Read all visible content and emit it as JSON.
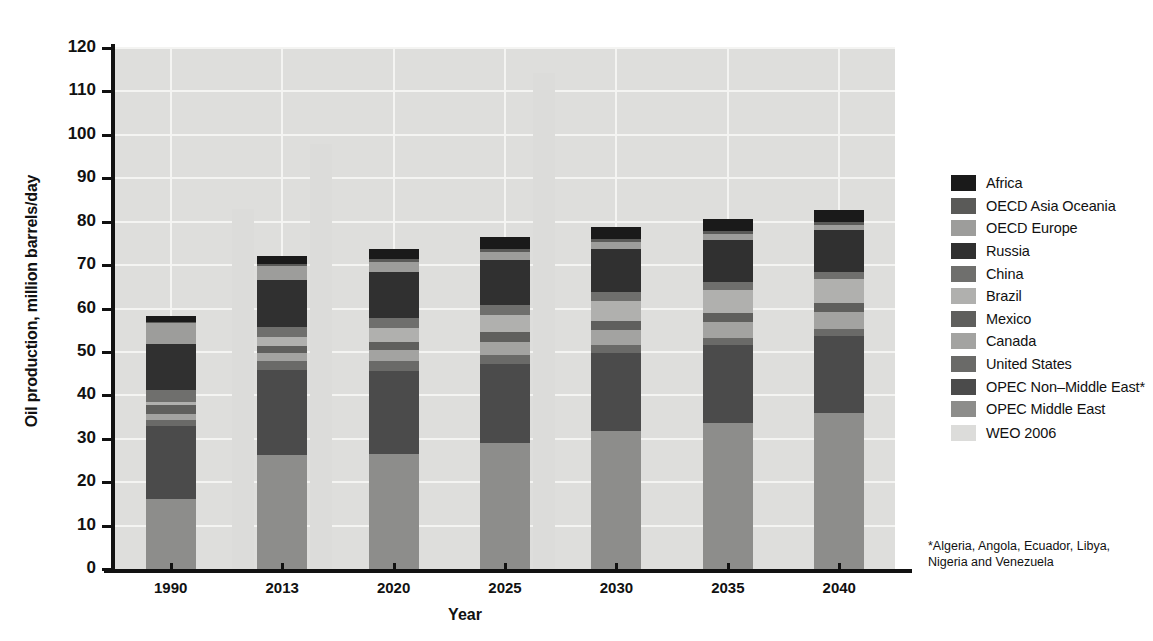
{
  "chart_data": {
    "type": "bar",
    "subtype": "stacked-bar-with-overlay",
    "title": "",
    "xlabel": "Year",
    "ylabel": "Oil production, million barrels/day",
    "ylim": [
      0,
      120
    ],
    "ytick_values": [
      0,
      10,
      20,
      30,
      40,
      50,
      60,
      70,
      80,
      90,
      100,
      110,
      120
    ],
    "ytick_labels": [
      "0",
      "10",
      "20",
      "30",
      "40",
      "50",
      "60",
      "70",
      "80",
      "90",
      "100",
      "110",
      "120"
    ],
    "grid": true,
    "legend_position": "right",
    "categories": [
      "1990",
      "2013",
      "2020",
      "2025",
      "2030",
      "2035",
      "2040"
    ],
    "stack_order_bottom_to_top": [
      "OPEC Middle East",
      "OPEC Non–Middle East*",
      "United States",
      "Canada",
      "Mexico",
      "Brazil",
      "China",
      "Russia",
      "OECD Europe",
      "OECD Asia Oceania",
      "Africa"
    ],
    "series": [
      {
        "name": "OPEC Middle East",
        "color": "#8d8d8b",
        "values": [
          16.2,
          26.2,
          26.6,
          29.0,
          31.8,
          33.7,
          35.9
        ]
      },
      {
        "name": "OPEC Non–Middle East*",
        "color": "#4b4b4b",
        "values": [
          16.7,
          19.7,
          19.0,
          18.3,
          18.0,
          18.0,
          17.8
        ]
      },
      {
        "name": "United States",
        "color": "#6a6a68",
        "values": [
          1.5,
          2.0,
          2.4,
          2.1,
          1.8,
          1.6,
          1.5
        ]
      },
      {
        "name": "Canada",
        "color": "#a3a3a1",
        "values": [
          1.3,
          1.8,
          2.4,
          3.0,
          3.4,
          3.7,
          4.0
        ]
      },
      {
        "name": "Mexico",
        "color": "#5f5f5d",
        "values": [
          2.0,
          1.7,
          1.9,
          2.1,
          2.1,
          2.0,
          2.0
        ]
      },
      {
        "name": "Brazil",
        "color": "#b0b0ae",
        "values": [
          0.8,
          2.0,
          3.2,
          4.0,
          4.6,
          5.2,
          5.6
        ]
      },
      {
        "name": "China",
        "color": "#6f6f6d",
        "values": [
          2.8,
          2.4,
          2.3,
          2.2,
          2.0,
          1.8,
          1.7
        ]
      },
      {
        "name": "Russia",
        "color": "#303030",
        "values": [
          10.5,
          10.7,
          10.6,
          10.4,
          10.1,
          9.8,
          9.6
        ]
      },
      {
        "name": "OECD Europe",
        "color": "#9d9d9b",
        "values": [
          4.9,
          3.2,
          2.3,
          1.9,
          1.6,
          1.4,
          1.2
        ]
      },
      {
        "name": "OECD Asia Oceania",
        "color": "#5a5a58",
        "values": [
          0.3,
          0.6,
          0.7,
          0.8,
          0.7,
          0.6,
          0.6
        ]
      },
      {
        "name": "Africa",
        "color": "#1a1a1a",
        "values": [
          1.2,
          1.8,
          2.3,
          2.6,
          2.7,
          2.8,
          2.9
        ]
      }
    ],
    "totals": [
      58.2,
      72.1,
      73.7,
      76.4,
      78.8,
      80.6,
      82.8
    ],
    "overlay": {
      "name": "WEO 2006",
      "color": "#dcdcda",
      "points": [
        {
          "category": "2013",
          "value": 83.0,
          "offset": "left"
        },
        {
          "category": "2013",
          "value": 97.8,
          "offset": "right"
        },
        {
          "category": "2025",
          "value": 114.3,
          "offset": "right"
        }
      ]
    },
    "footnote": "*Algeria, Angola, Ecuador, Libya, Nigeria and Venezuela"
  },
  "axes": {
    "ylabel": "Oil production, million barrels/day",
    "xlabel": "Year",
    "yticks": [
      "120",
      "110",
      "100",
      "90",
      "80",
      "70",
      "60",
      "50",
      "40",
      "30",
      "20",
      "10",
      "0"
    ],
    "xticks": [
      "1990",
      "2013",
      "2020",
      "2025",
      "2030",
      "2035",
      "2040"
    ]
  },
  "legend": {
    "items": [
      {
        "label": "Africa",
        "color": "#1a1a1a"
      },
      {
        "label": "OECD Asia Oceania",
        "color": "#5a5a58"
      },
      {
        "label": "OECD Europe",
        "color": "#9d9d9b"
      },
      {
        "label": "Russia",
        "color": "#303030"
      },
      {
        "label": "China",
        "color": "#6f6f6d"
      },
      {
        "label": "Brazil",
        "color": "#b0b0ae"
      },
      {
        "label": "Mexico",
        "color": "#5f5f5d"
      },
      {
        "label": "Canada",
        "color": "#a3a3a1"
      },
      {
        "label": "United States",
        "color": "#6a6a68"
      },
      {
        "label": "OPEC Non–Middle East*",
        "color": "#4b4b4b"
      },
      {
        "label": "OPEC Middle East",
        "color": "#8d8d8b"
      }
    ],
    "overlay": {
      "label": "WEO 2006",
      "color": "#dcdcda"
    }
  },
  "footnote": {
    "line1": "*Algeria, Angola, Ecuador, Libya,",
    "line2": "Nigeria and Venezuela"
  },
  "colors": {
    "plot_background": "#dededc",
    "gridline": "#f4f4f2",
    "axis": "#111111",
    "page_background": "#ffffff"
  }
}
